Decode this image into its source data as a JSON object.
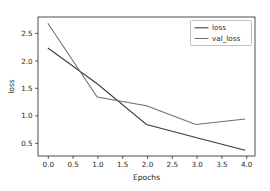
{
  "chart_data": {
    "type": "line",
    "title": "",
    "xlabel": "Epochs",
    "ylabel": "loss",
    "x": [
      0,
      1,
      2,
      3,
      4
    ],
    "series": [
      {
        "name": "loss",
        "values": [
          2.25,
          1.6,
          0.86,
          0.62,
          0.39
        ],
        "color": "#3b3b3b"
      },
      {
        "name": "val_loss",
        "values": [
          2.7,
          1.36,
          1.2,
          0.86,
          0.96
        ],
        "color": "#6e6e6e"
      }
    ],
    "xlim": [
      -0.2,
      4.2
    ],
    "ylim": [
      0.285,
      2.815
    ],
    "xticks": [
      0.0,
      0.5,
      1.0,
      1.5,
      2.0,
      2.5,
      3.0,
      3.5,
      4.0
    ],
    "xticklabels": [
      "0.0",
      "0.5",
      "1.0",
      "1.5",
      "2.0",
      "2.5",
      "3.0",
      "3.5",
      "4.0"
    ],
    "yticks": [
      0.5,
      1.0,
      1.5,
      2.0,
      2.5
    ],
    "yticklabels": [
      "0.5",
      "1.0",
      "1.5",
      "2.0",
      "2.5"
    ],
    "grid": false,
    "legend": {
      "position": "upper right",
      "entries": [
        "loss",
        "val_loss"
      ]
    }
  },
  "figure": {
    "background": "#ffffff",
    "axes_color": "#3b3b3b"
  }
}
